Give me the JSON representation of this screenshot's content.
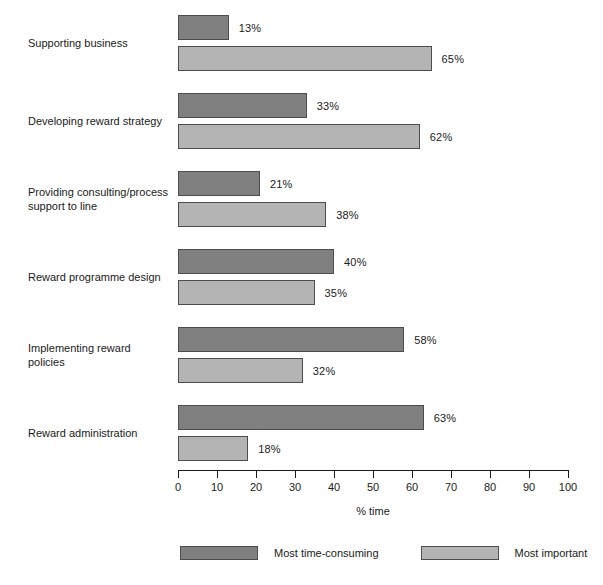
{
  "chart_data": {
    "type": "bar",
    "orientation": "horizontal",
    "title": "",
    "xlabel": "% time",
    "ylabel": "",
    "xlim": [
      0,
      100
    ],
    "xticks": [
      0,
      10,
      20,
      30,
      40,
      50,
      60,
      70,
      80,
      90,
      100
    ],
    "xtick_labels": [
      "0",
      "10",
      "20",
      "30",
      "40",
      "50",
      "60",
      "70",
      "80",
      "90",
      "100"
    ],
    "grid": false,
    "legend_position": "bottom",
    "value_suffix": "%",
    "categories": [
      "Supporting business",
      "Developing reward strategy",
      "Providing consulting/process support to line",
      "Reward programme design",
      "Implementing reward policies",
      "Reward administration"
    ],
    "category_labels_wrapped": [
      "Supporting business",
      "Developing reward strategy",
      "Providing consulting/process\nsupport to line",
      "Reward programme design",
      "Implementing reward\npolicies",
      "Reward administration"
    ],
    "series": [
      {
        "name": "Most time-consuming",
        "color": "#808080",
        "values": [
          13,
          33,
          21,
          40,
          58,
          63
        ],
        "value_labels": [
          "13%",
          "33%",
          "21%",
          "40%",
          "58%",
          "63%"
        ]
      },
      {
        "name": "Most important",
        "color": "#b4b4b4",
        "values": [
          65,
          62,
          38,
          35,
          32,
          18
        ],
        "value_labels": [
          "65%",
          "62%",
          "38%",
          "35%",
          "32%",
          "18%"
        ]
      }
    ]
  },
  "axis": {
    "title": "% time"
  },
  "legend": {
    "items": [
      {
        "label": "Most time-consuming",
        "color": "#808080"
      },
      {
        "label": "Most important",
        "color": "#b4b4b4"
      }
    ]
  }
}
